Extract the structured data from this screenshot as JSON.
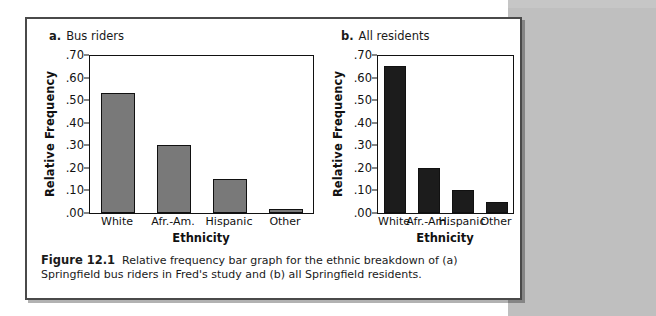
{
  "figure": {
    "caption_label": "Figure 12.1",
    "caption_text": "Relative frequency bar graph for the ethnic breakdown of (a) Springfield bus riders in Fred's study and (b) all Springfield residents."
  },
  "panel_a": {
    "letter": "a.",
    "title": "Bus riders"
  },
  "panel_b": {
    "letter": "b.",
    "title": "All residents"
  },
  "colors": {
    "panel_a_bar": "#797979",
    "panel_b_bar": "#1c1c1c",
    "axis": "#111111",
    "page_band": "#bfbfbf",
    "card_border": "#4a4a4a"
  },
  "chart_data": [
    {
      "type": "bar",
      "title": "a. Bus riders",
      "categories": [
        "White",
        "Afr.-Am.",
        "Hispanic",
        "Other"
      ],
      "values": [
        0.53,
        0.3,
        0.15,
        0.02
      ],
      "xlabel": "Ethnicity",
      "ylabel": "Relative Frequency",
      "ylim": [
        0.0,
        0.7
      ],
      "yticks": [
        0.0,
        0.1,
        0.2,
        0.3,
        0.4,
        0.5,
        0.6,
        0.7
      ],
      "ytick_labels": [
        ".00",
        ".10",
        ".20",
        ".30",
        ".40",
        ".50",
        ".60",
        ".70"
      ],
      "grid": false,
      "legend": false,
      "bar_color": "#797979"
    },
    {
      "type": "bar",
      "title": "b. All residents",
      "categories": [
        "White",
        "Afr.-Am.",
        "Hispanic",
        "Other"
      ],
      "values": [
        0.65,
        0.2,
        0.1,
        0.05
      ],
      "xlabel": "Ethnicity",
      "ylabel": "Relative Frequency",
      "ylim": [
        0.0,
        0.7
      ],
      "yticks": [
        0.0,
        0.1,
        0.2,
        0.3,
        0.4,
        0.5,
        0.6,
        0.7
      ],
      "ytick_labels": [
        ".00",
        ".10",
        ".20",
        ".30",
        ".40",
        ".50",
        ".60",
        ".70"
      ],
      "grid": false,
      "legend": false,
      "bar_color": "#1c1c1c"
    }
  ]
}
